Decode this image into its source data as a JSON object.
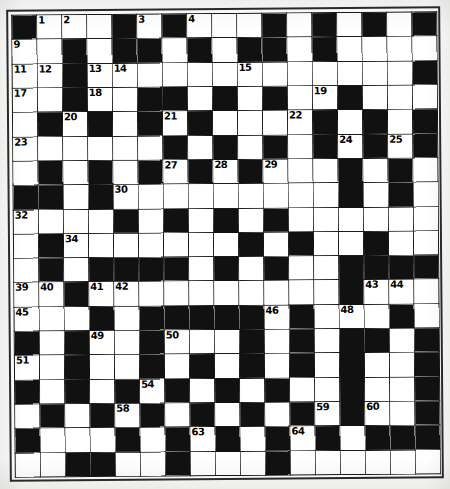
{
  "document": {
    "type": "crossword-puzzle-grid",
    "title": "Crossword Puzzle",
    "columns": 17,
    "rows": 19,
    "colors": {
      "block": "#111111",
      "open": "#ffffff",
      "border": "#1a1a1a",
      "paper": "#fbfbf9"
    }
  },
  "grid": {
    "legend": {
      "block": "#",
      "open": "."
    },
    "rows": [
      "#...#.#...#.#.#.#",
      "..#.##.#.##.#....",
      "..#.............#",
      "..#..##.#.#..#...",
      ".#.#.#.#....#.#.#",
      "......#.#.#.#.#.#",
      ".#.#.#.#.#...#.#.",
      "##.#.........#.#.",
      "....#.#.#.#......",
      ".#.......#.#..#..",
      ".#.####.#.#..####",
      "..#..........#...",
      "...#.#####.#...#.",
      "#.#..#...#.#.##.#",
      "..#..#.#.#.#.#..#",
      "#.#.#.#.#.#..#..#",
      ".#.#.#.#.#.#.#..#",
      "#...#.#.#.#.#.###",
      "..##..#...#......"
    ],
    "numbers": [
      {
        "n": 1,
        "row": 1,
        "col": 2
      },
      {
        "n": 2,
        "row": 1,
        "col": 3
      },
      {
        "n": 3,
        "row": 1,
        "col": 6
      },
      {
        "n": 4,
        "row": 1,
        "col": 8
      },
      {
        "n": 5,
        "row": 1,
        "col": 11
      },
      {
        "n": 6,
        "row": 1,
        "col": 13
      },
      {
        "n": 7,
        "row": 1,
        "col": 15
      },
      {
        "n": 8,
        "row": 1,
        "col": 17
      },
      {
        "n": 9,
        "row": 2,
        "col": 1
      },
      {
        "n": 10,
        "row": 2,
        "col": 13
      },
      {
        "n": 11,
        "row": 3,
        "col": 1
      },
      {
        "n": 12,
        "row": 3,
        "col": 2
      },
      {
        "n": 13,
        "row": 3,
        "col": 4
      },
      {
        "n": 14,
        "row": 3,
        "col": 5
      },
      {
        "n": 15,
        "row": 3,
        "col": 10
      },
      {
        "n": 16,
        "row": 3,
        "col": 17
      },
      {
        "n": 17,
        "row": 4,
        "col": 1
      },
      {
        "n": 18,
        "row": 4,
        "col": 4
      },
      {
        "n": 19,
        "row": 4,
        "col": 13
      },
      {
        "n": 20,
        "row": 5,
        "col": 3
      },
      {
        "n": 21,
        "row": 5,
        "col": 7
      },
      {
        "n": 22,
        "row": 5,
        "col": 12
      },
      {
        "n": 23,
        "row": 6,
        "col": 1
      },
      {
        "n": 24,
        "row": 6,
        "col": 14
      },
      {
        "n": 25,
        "row": 6,
        "col": 16
      },
      {
        "n": 26,
        "row": 6,
        "col": 18
      },
      {
        "n": 27,
        "row": 7,
        "col": 7
      },
      {
        "n": 28,
        "row": 7,
        "col": 9
      },
      {
        "n": 29,
        "row": 7,
        "col": 11
      },
      {
        "n": 30,
        "row": 8,
        "col": 5
      },
      {
        "n": 31,
        "row": 8,
        "col": 14
      },
      {
        "n": 32,
        "row": 9,
        "col": 1
      },
      {
        "n": 33,
        "row": 9,
        "col": 11
      },
      {
        "n": 34,
        "row": 10,
        "col": 3
      },
      {
        "n": 35,
        "row": 10,
        "col": 10
      },
      {
        "n": 36,
        "row": 10,
        "col": 15
      },
      {
        "n": 37,
        "row": 11,
        "col": 9
      },
      {
        "n": 38,
        "row": 11,
        "col": 11
      },
      {
        "n": 39,
        "row": 12,
        "col": 1
      },
      {
        "n": 40,
        "row": 12,
        "col": 2
      },
      {
        "n": 41,
        "row": 12,
        "col": 4
      },
      {
        "n": 42,
        "row": 12,
        "col": 5
      },
      {
        "n": 43,
        "row": 12,
        "col": 15
      },
      {
        "n": 44,
        "row": 12,
        "col": 16
      },
      {
        "n": 45,
        "row": 13,
        "col": 1
      },
      {
        "n": 46,
        "row": 13,
        "col": 11
      },
      {
        "n": 47,
        "row": 13,
        "col": 12
      },
      {
        "n": 48,
        "row": 13,
        "col": 14
      },
      {
        "n": 49,
        "row": 14,
        "col": 4
      },
      {
        "n": 50,
        "row": 14,
        "col": 7
      },
      {
        "n": 51,
        "row": 15,
        "col": 1
      },
      {
        "n": 52,
        "row": 15,
        "col": 14
      },
      {
        "n": 53,
        "row": 15,
        "col": 17
      },
      {
        "n": 54,
        "row": 16,
        "col": 6
      },
      {
        "n": 55,
        "row": 16,
        "col": 9
      },
      {
        "n": 56,
        "row": 16,
        "col": 11
      },
      {
        "n": 57,
        "row": 17,
        "col": 2
      },
      {
        "n": 58,
        "row": 17,
        "col": 5
      },
      {
        "n": 59,
        "row": 17,
        "col": 13
      },
      {
        "n": 60,
        "row": 17,
        "col": 15
      },
      {
        "n": 61,
        "row": 18,
        "col": 1
      },
      {
        "n": 62,
        "row": 18,
        "col": 5
      },
      {
        "n": 63,
        "row": 18,
        "col": 8
      },
      {
        "n": 64,
        "row": 18,
        "col": 12
      }
    ]
  }
}
